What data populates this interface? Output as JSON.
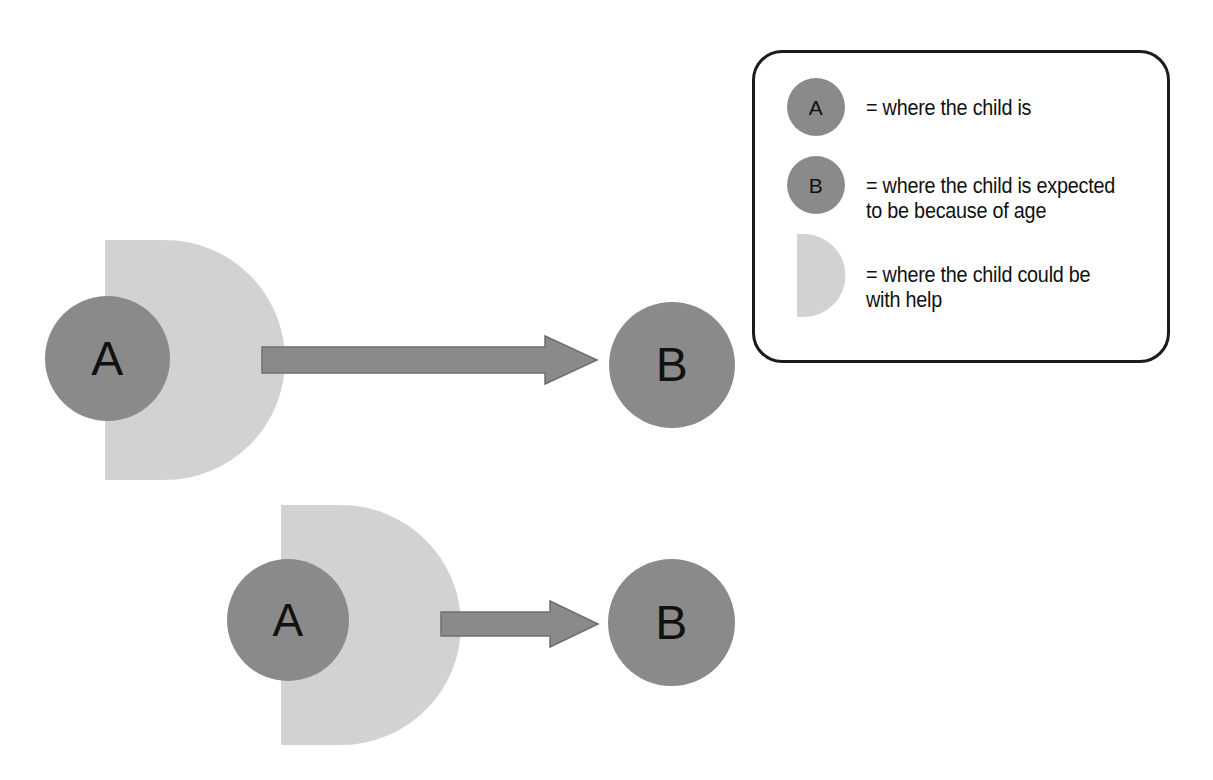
{
  "canvas": {
    "width": 1213,
    "height": 780,
    "background": "#ffffff"
  },
  "palette": {
    "circle_gray": "#8a8a8a",
    "zone_gray": "#d2d2d2",
    "arrow_gray": "#8a8a8a",
    "arrow_outline": "#6f6f6f",
    "text_black": "#111111",
    "legend_border": "#1b1b1b"
  },
  "diagram": {
    "type": "conceptual-diagram",
    "rows": [
      {
        "id": "row-large-gap",
        "description": "large zone of proximal development with long arrow to B",
        "zone": {
          "x": 105,
          "y": 240,
          "width": 132,
          "height": 240,
          "fill": "#d2d2d2"
        },
        "circle_a": {
          "label": "A",
          "cx": 107,
          "cy": 358,
          "d": 125,
          "fill": "#8a8a8a",
          "font_size": 48
        },
        "arrow": {
          "x1": 262,
          "y1": 360,
          "x2": 597,
          "y2": 360,
          "shaft_h": 26,
          "head_w": 52,
          "head_h": 48
        },
        "circle_b": {
          "label": "B",
          "cx": 672,
          "cy": 365,
          "d": 126,
          "fill": "#8a8a8a",
          "font_size": 48
        }
      },
      {
        "id": "row-small-gap",
        "description": "shifted zone of proximal development with short arrow to B",
        "zone": {
          "x": 281,
          "y": 505,
          "width": 132,
          "height": 240,
          "fill": "#d2d2d2"
        },
        "circle_a": {
          "label": "A",
          "cx": 288,
          "cy": 620,
          "d": 122,
          "fill": "#8a8a8a",
          "font_size": 46
        },
        "arrow": {
          "x1": 441,
          "y1": 624,
          "x2": 598,
          "y2": 624,
          "shaft_h": 25,
          "head_w": 48,
          "head_h": 46
        },
        "circle_b": {
          "label": "B",
          "cx": 672,
          "cy": 623,
          "d": 127,
          "fill": "#8a8a8a",
          "font_size": 48
        }
      }
    ]
  },
  "legend": {
    "box": {
      "x": 752,
      "y": 50,
      "width": 418,
      "height": 313,
      "radius": 30,
      "border": "#1b1b1b"
    },
    "items": [
      {
        "swatch": "circle",
        "swatch_label": "A",
        "text": "= where the child is"
      },
      {
        "swatch": "circle",
        "swatch_label": "B",
        "text": "= where the child is expected\nto be because of age"
      },
      {
        "swatch": "d-shape",
        "swatch_label": "",
        "text": "= where the child could be\nwith help"
      }
    ]
  }
}
